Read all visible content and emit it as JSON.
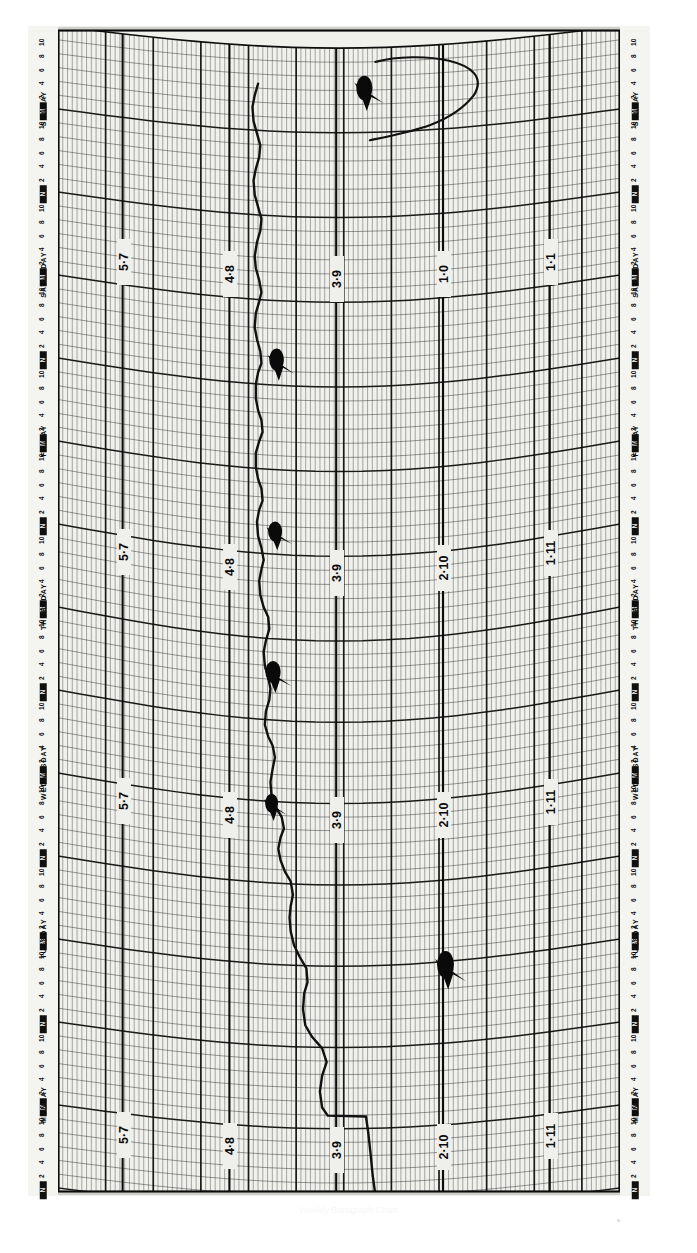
{
  "document": {
    "kind": "barograph-chart-scan",
    "title": "Weekly Barograph Chart",
    "orientation": "rotated-90"
  },
  "axis": {
    "day_labels": [
      "MONDAY",
      "TUESDAY",
      "WEDNESDAY",
      "THURSDAY",
      "FRIDAY",
      "SATURDAY",
      "SUNDAY"
    ],
    "hour_ticks": [
      "N",
      "2",
      "4",
      "6",
      "8",
      "10",
      "M",
      "2",
      "4",
      "6",
      "8",
      "10"
    ],
    "noon_label": "N",
    "midnight_label": "M"
  },
  "scale": {
    "labels_bottom": [
      "5·7",
      "4·8",
      "3·9",
      "2·10",
      "1·11"
    ],
    "labels_middle": [
      "5·7",
      "4·8",
      "3·9",
      "2·10",
      "1·11"
    ],
    "labels_top": [
      "5·7",
      "4·8",
      "3·9",
      "1·0",
      "1·1"
    ],
    "unit_note": "inches of mercury (tenths)"
  },
  "colors": {
    "paper": "#efefec",
    "rail": "#f4f4f1",
    "grid_fine": "#2b2b2b",
    "grid_major": "#0d0d0d",
    "trace": "#111111",
    "blot": "#0a0a0a",
    "page": "#ffffff"
  },
  "chart_data": {
    "type": "line",
    "title": "Weekly Barograph Chart",
    "xlabel": "Pressure (scale divisions)",
    "ylabel": "Day / Hour",
    "grid": true,
    "legend": false,
    "axis_note": "Drum chart rotated 90°: time runs bottom (Monday) to top (Sunday); pressure runs left (high) to right (low).",
    "x_tick_labels": [
      "5·7",
      "4·8",
      "3·9",
      "2·10",
      "1·11"
    ],
    "y_tick_labels": [
      "MONDAY",
      "TUESDAY",
      "WEDNESDAY",
      "THURSDAY",
      "FRIDAY",
      "SATURDAY",
      "SUNDAY"
    ],
    "series": [
      {
        "name": "Barometric pressure trace",
        "points": [
          [
            0.565,
            0.012
          ],
          [
            0.56,
            0.03
          ],
          [
            0.556,
            0.05
          ],
          [
            0.552,
            0.068
          ],
          [
            0.548,
            0.082
          ],
          [
            0.48,
            0.083
          ],
          [
            0.47,
            0.09
          ],
          [
            0.466,
            0.104
          ],
          [
            0.47,
            0.118
          ],
          [
            0.478,
            0.13
          ],
          [
            0.47,
            0.142
          ],
          [
            0.452,
            0.152
          ],
          [
            0.44,
            0.162
          ],
          [
            0.436,
            0.176
          ],
          [
            0.438,
            0.19
          ],
          [
            0.444,
            0.2
          ],
          [
            0.442,
            0.212
          ],
          [
            0.43,
            0.222
          ],
          [
            0.42,
            0.232
          ],
          [
            0.414,
            0.244
          ],
          [
            0.412,
            0.256
          ],
          [
            0.414,
            0.266
          ],
          [
            0.418,
            0.276
          ],
          [
            0.414,
            0.288
          ],
          [
            0.404,
            0.296
          ],
          [
            0.396,
            0.306
          ],
          [
            0.392,
            0.316
          ],
          [
            0.396,
            0.326
          ],
          [
            0.402,
            0.334
          ],
          [
            0.398,
            0.344
          ],
          [
            0.388,
            0.352
          ],
          [
            0.38,
            0.362
          ],
          [
            0.378,
            0.374
          ],
          [
            0.382,
            0.386
          ],
          [
            0.386,
            0.396
          ],
          [
            0.382,
            0.406
          ],
          [
            0.374,
            0.414
          ],
          [
            0.368,
            0.424
          ],
          [
            0.37,
            0.436
          ],
          [
            0.376,
            0.446
          ],
          [
            0.378,
            0.456
          ],
          [
            0.374,
            0.466
          ],
          [
            0.368,
            0.476
          ],
          [
            0.366,
            0.488
          ],
          [
            0.37,
            0.498
          ],
          [
            0.376,
            0.508
          ],
          [
            0.374,
            0.518
          ],
          [
            0.366,
            0.526
          ],
          [
            0.36,
            0.536
          ],
          [
            0.358,
            0.548
          ],
          [
            0.362,
            0.558
          ],
          [
            0.366,
            0.566
          ],
          [
            0.362,
            0.576
          ],
          [
            0.356,
            0.586
          ],
          [
            0.354,
            0.598
          ],
          [
            0.358,
            0.608
          ],
          [
            0.364,
            0.616
          ],
          [
            0.362,
            0.626
          ],
          [
            0.356,
            0.634
          ],
          [
            0.352,
            0.644
          ],
          [
            0.352,
            0.656
          ],
          [
            0.358,
            0.666
          ],
          [
            0.364,
            0.674
          ],
          [
            0.362,
            0.684
          ],
          [
            0.356,
            0.692
          ],
          [
            0.352,
            0.702
          ],
          [
            0.352,
            0.714
          ],
          [
            0.356,
            0.724
          ],
          [
            0.362,
            0.732
          ],
          [
            0.36,
            0.742
          ],
          [
            0.354,
            0.752
          ],
          [
            0.35,
            0.762
          ],
          [
            0.352,
            0.774
          ],
          [
            0.358,
            0.784
          ],
          [
            0.362,
            0.792
          ],
          [
            0.358,
            0.802
          ],
          [
            0.352,
            0.812
          ],
          [
            0.35,
            0.822
          ],
          [
            0.354,
            0.834
          ],
          [
            0.36,
            0.844
          ],
          [
            0.362,
            0.854
          ],
          [
            0.356,
            0.864
          ],
          [
            0.35,
            0.874
          ],
          [
            0.348,
            0.886
          ],
          [
            0.352,
            0.896
          ],
          [
            0.358,
            0.906
          ],
          [
            0.36,
            0.916
          ],
          [
            0.354,
            0.926
          ],
          [
            0.348,
            0.936
          ],
          [
            0.346,
            0.948
          ],
          [
            0.35,
            0.958
          ],
          [
            0.356,
            0.968
          ]
        ]
      }
    ],
    "ink_blots": [
      {
        "x": 0.555,
        "y": 0.965,
        "w": 0.055,
        "h": 0.022
      },
      {
        "x": 0.398,
        "y": 0.735,
        "w": 0.05,
        "h": 0.02
      },
      {
        "x": 0.395,
        "y": 0.59,
        "w": 0.048,
        "h": 0.018
      },
      {
        "x": 0.392,
        "y": 0.47,
        "w": 0.052,
        "h": 0.02
      },
      {
        "x": 0.388,
        "y": 0.355,
        "w": 0.044,
        "h": 0.017
      },
      {
        "x": 0.7,
        "y": 0.21,
        "w": 0.058,
        "h": 0.024
      }
    ],
    "pressure_range_note": "Trace spans roughly 1·11 to 5·7 divisions across the week"
  }
}
